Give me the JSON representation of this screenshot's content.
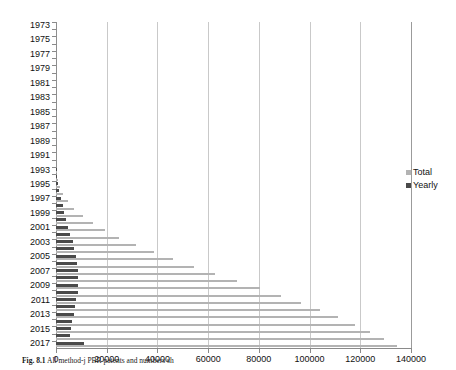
{
  "figure": {
    "caption_number": "Fig. 8.1",
    "caption_text": "All method-j PBR patents and numbers sh"
  },
  "legend": {
    "position": "right",
    "items": [
      {
        "label": "Total",
        "color": "#b3b3b3",
        "name": "total"
      },
      {
        "label": "Yearly",
        "color": "#4a4a4a",
        "name": "yearly"
      }
    ]
  },
  "chart_data": {
    "type": "bar",
    "orientation": "horizontal",
    "title": "",
    "xlabel": "",
    "ylabel": "",
    "xlim": [
      0,
      140000
    ],
    "ylim_categories": "1973-2017",
    "xticks": [
      0,
      20000,
      40000,
      60000,
      80000,
      100000,
      120000,
      140000
    ],
    "xtick_labels": [
      "0",
      "20000",
      "40000",
      "60000",
      "80000",
      "100000",
      "120000",
      "140000"
    ],
    "grid": true,
    "grid_axis": "x",
    "legend_position": "right",
    "categories": [
      1973,
      1974,
      1975,
      1976,
      1977,
      1978,
      1979,
      1980,
      1981,
      1982,
      1983,
      1984,
      1985,
      1986,
      1987,
      1988,
      1989,
      1990,
      1991,
      1992,
      1993,
      1994,
      1995,
      1996,
      1997,
      1998,
      1999,
      2000,
      2001,
      2002,
      2003,
      2004,
      2005,
      2006,
      2007,
      2008,
      2009,
      2010,
      2011,
      2012,
      2013,
      2014,
      2015,
      2016,
      2017
    ],
    "ytick_labels": [
      "1973",
      "1975",
      "1977",
      "1979",
      "1981",
      "1983",
      "1985",
      "1987",
      "1989",
      "1991",
      "1993",
      "1995",
      "1997",
      "1999",
      "2001",
      "2003",
      "2005",
      "2007",
      "2009",
      "2011",
      "2013",
      "2015",
      "2017"
    ],
    "series": [
      {
        "name": "Total",
        "color": "#b3b3b3",
        "values": [
          0,
          0,
          0,
          0,
          0,
          0,
          0,
          0,
          0,
          0,
          0,
          0,
          0,
          0,
          0,
          0,
          0,
          0,
          0,
          0,
          300,
          800,
          1600,
          2800,
          4600,
          7200,
          10500,
          14500,
          19200,
          24800,
          31400,
          38500,
          46200,
          54300,
          62800,
          71500,
          80300,
          88800,
          96800,
          104300,
          111300,
          117800,
          123800,
          129300,
          134400
        ]
      },
      {
        "name": "Yearly",
        "color": "#4a4a4a",
        "values": [
          0,
          0,
          0,
          0,
          0,
          0,
          0,
          0,
          0,
          0,
          0,
          0,
          0,
          0,
          0,
          0,
          0,
          0,
          0,
          0,
          300,
          500,
          800,
          1200,
          1800,
          2600,
          3300,
          4000,
          4700,
          5600,
          6600,
          7100,
          7700,
          8100,
          8500,
          8700,
          8800,
          8500,
          8000,
          7500,
          7000,
          6500,
          6000,
          5500,
          11000
        ]
      }
    ]
  }
}
